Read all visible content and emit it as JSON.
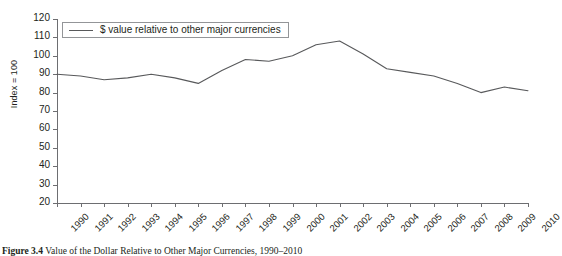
{
  "chart_data": {
    "type": "line",
    "title": "",
    "xlabel": "",
    "ylabel": "Index = 100",
    "ylim": [
      20,
      120
    ],
    "yticks": [
      120,
      110,
      100,
      90,
      80,
      70,
      60,
      50,
      40,
      30,
      20
    ],
    "grid": false,
    "legend_position": "top-left",
    "categories": [
      "1990",
      "1991",
      "1992",
      "1993",
      "1994",
      "1995",
      "1996",
      "1997",
      "1998",
      "1999",
      "2000",
      "2001",
      "2002",
      "2003",
      "2004",
      "2005",
      "2006",
      "2007",
      "2008",
      "2009",
      "2010"
    ],
    "series": [
      {
        "name": "$ value relative to other major currencies",
        "color": "#58595b",
        "values": [
          90,
          89,
          87,
          88,
          90,
          88,
          85,
          92,
          98,
          97,
          100,
          106,
          108,
          101,
          93,
          91,
          89,
          85,
          80,
          83,
          81
        ]
      }
    ]
  },
  "legend": {
    "label": "$ value relative to other major currencies"
  },
  "caption": {
    "prefix": "Figure 3.4",
    "text": "Value of the Dollar Relative to Other Major Currencies, 1990–2010"
  }
}
